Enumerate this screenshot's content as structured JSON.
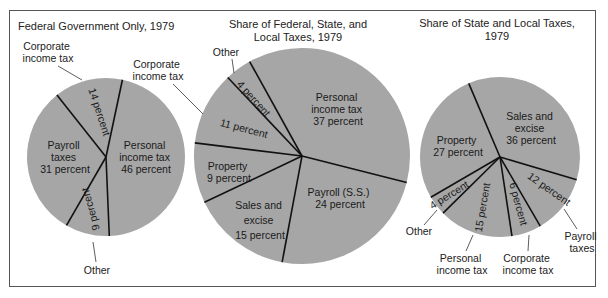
{
  "chart_data": [
    {
      "type": "pie",
      "title": "Federal Government Only, 1979",
      "categories": [
        "Personal income tax",
        "Other",
        "Payroll taxes",
        "Corporate income tax"
      ],
      "values": [
        46,
        9,
        31,
        14
      ],
      "unit": "percent",
      "labels": [
        {
          "lines": [
            "Personal",
            "income tax",
            "46 percent"
          ],
          "placement": "inside"
        },
        {
          "lines": [
            "9 percent"
          ],
          "placement": "inside-rotated",
          "external": "Other"
        },
        {
          "lines": [
            "Payroll",
            "taxes",
            "31 percent"
          ],
          "placement": "inside"
        },
        {
          "lines": [
            "14 percent"
          ],
          "placement": "inside-rotated",
          "external": "Corporate income tax"
        }
      ],
      "external_labels": [
        [
          "Corporate",
          "income tax"
        ],
        [
          "Other"
        ]
      ]
    },
    {
      "type": "pie",
      "title": "Share of Federal, State, and Local Taxes, 1979",
      "title_lines": [
        "Share of Federal, State, and",
        "Local Taxes, 1979"
      ],
      "categories": [
        "Personal income tax",
        "Payroll (S.S.)",
        "Sales and excise",
        "Property",
        "Corporate income tax",
        "Other"
      ],
      "values": [
        37,
        24,
        15,
        9,
        11,
        4
      ],
      "unit": "percent",
      "labels": [
        {
          "lines": [
            "Personal",
            "income tax",
            "37 percent"
          ]
        },
        {
          "lines": [
            "Payroll (S.S.)",
            "24 percent"
          ]
        },
        {
          "lines": [
            "Sales and",
            "excise",
            "15 percent"
          ]
        },
        {
          "lines": [
            "Property",
            "9 percent"
          ]
        },
        {
          "lines": [
            "11 percent"
          ]
        },
        {
          "lines": [
            "4 percent"
          ]
        }
      ],
      "external_labels": [
        [
          "Corporate",
          "income tax"
        ],
        [
          "Other"
        ]
      ]
    },
    {
      "type": "pie",
      "title": "Share of State and Local Taxes, 1979",
      "title_lines": [
        "Share of State and Local Taxes,",
        "1979"
      ],
      "categories": [
        "Sales and excise",
        "Payroll taxes",
        "Corporate income tax",
        "Personal income tax",
        "Other",
        "Property"
      ],
      "values": [
        36,
        12,
        6,
        15,
        4,
        27
      ],
      "unit": "percent",
      "labels": [
        {
          "lines": [
            "Sales and",
            "excise",
            "36 percent"
          ]
        },
        {
          "lines": [
            "12 percent"
          ]
        },
        {
          "lines": [
            "6 percent"
          ]
        },
        {
          "lines": [
            "15 percent"
          ]
        },
        {
          "lines": [
            "4 percent"
          ]
        },
        {
          "lines": [
            "Property",
            "27 percent"
          ]
        }
      ],
      "external_labels": [
        [
          "Other"
        ],
        [
          "Personal",
          "income tax"
        ],
        [
          "Corporate",
          "income tax"
        ],
        [
          "Payroll",
          "taxes"
        ]
      ]
    }
  ],
  "style": {
    "slice_color": "#a6a6a6",
    "divider_color": "#111111"
  }
}
